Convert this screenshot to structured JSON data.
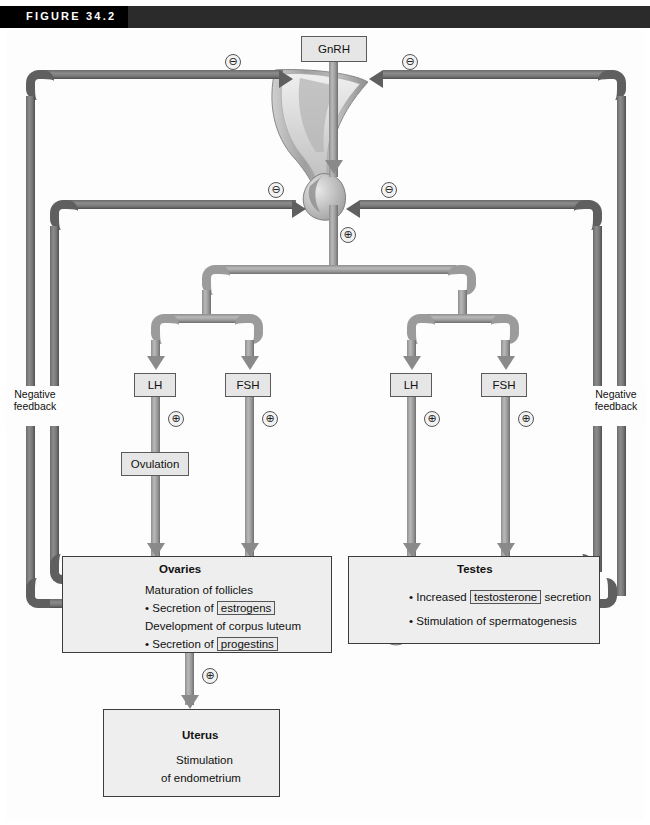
{
  "figure": {
    "label": "FIGURE 34.2"
  },
  "nodes": {
    "gnrh": "GnRH",
    "lh_left": "LH",
    "fsh_left": "FSH",
    "lh_right": "LH",
    "fsh_right": "FSH",
    "ovulation": "Ovulation"
  },
  "feedback": {
    "left_label": "Negative\nfeedback",
    "left_line1": "Negative",
    "left_line2": "feedback",
    "right_line1": "Negative",
    "right_line2": "feedback",
    "minus": "⊖",
    "plus": "⊕"
  },
  "ovaries": {
    "title": "Ovaries",
    "line1": "Maturation of follicles",
    "line2_pre": "• Secretion of",
    "line2_kw": "estrogens",
    "line3": "Development of corpus luteum",
    "line4_pre": "• Secretion of",
    "line4_kw": "progestins"
  },
  "testes": {
    "title": "Testes",
    "line1_pre": "• Increased",
    "line1_kw": "testosterone",
    "line1_post": "secretion",
    "line2": "• Stimulation of spermatogenesis"
  },
  "uterus": {
    "title": "Uterus",
    "line1": "Stimulation",
    "line2": "of endometrium"
  },
  "icons": {
    "hypothalamus": "hypothalamus-illustration",
    "pituitary": "pituitary-illustration",
    "ovary": "ovary-illustration",
    "testis": "testis-illustration",
    "uterus": "uterus-illustration"
  },
  "colors": {
    "bar": "#2b2b2b",
    "pipe": "#9b9b9b",
    "pipe_dark": "#5f5f5f",
    "box_fill": "#e6e6e6",
    "panel_fill": "#eeeeee"
  }
}
